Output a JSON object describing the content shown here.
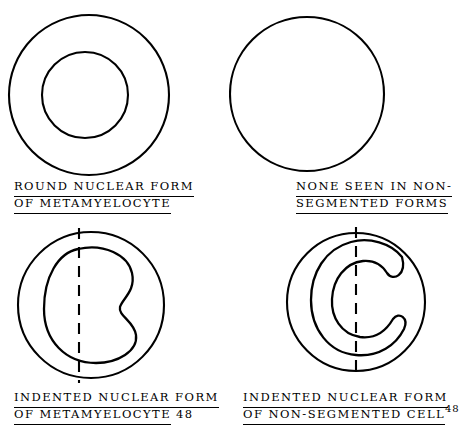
{
  "figure": {
    "background_color": "#ffffff",
    "stroke_color": "#000000",
    "panels": [
      {
        "id": "round-nuclear-form-metamyelocyte",
        "caption_lines": [
          "ROUND NUCLEAR FORM",
          "OF METAMYELOCYTE"
        ],
        "reference": "",
        "reference_style": "none",
        "nucleus_shape": "circle",
        "cell_outline": "circle"
      },
      {
        "id": "none-seen-non-segmented-forms",
        "caption_lines": [
          "NONE SEEN IN NON-",
          "SEGMENTED FORMS"
        ],
        "reference": "",
        "reference_style": "none",
        "nucleus_shape": "none",
        "cell_outline": "circle"
      },
      {
        "id": "indented-nuclear-form-metamyelocyte",
        "caption_lines": [
          "INDENTED NUCLEAR FORM",
          "OF METAMYELOCYTE"
        ],
        "reference": "48",
        "reference_style": "baseline",
        "nucleus_shape": "kidney-bean",
        "cell_outline": "circle",
        "has_dashed_axis": true
      },
      {
        "id": "indented-nuclear-form-non-segmented-cell",
        "caption_lines": [
          "INDENTED NUCLEAR FORM",
          "OF NON-SEGMENTED CELL"
        ],
        "reference": "48",
        "reference_style": "superscript",
        "nucleus_shape": "c-band",
        "cell_outline": "circle",
        "has_dashed_axis": true
      }
    ]
  }
}
